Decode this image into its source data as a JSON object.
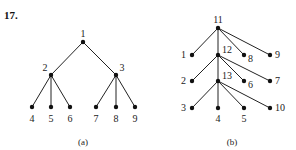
{
  "problem_number": "17.",
  "trees": [
    {
      "caption": "(a)",
      "nodes": [
        {
          "id": "1",
          "x": 83,
          "y": 42,
          "lx": 83,
          "ly": 37,
          "anchor": "middle"
        },
        {
          "id": "2",
          "x": 51,
          "y": 75,
          "lx": 45,
          "ly": 71,
          "anchor": "middle"
        },
        {
          "id": "3",
          "x": 116,
          "y": 75,
          "lx": 122,
          "ly": 71,
          "anchor": "middle"
        },
        {
          "id": "4",
          "x": 32,
          "y": 107,
          "lx": 32,
          "ly": 122,
          "anchor": "middle"
        },
        {
          "id": "5",
          "x": 51,
          "y": 107,
          "lx": 51,
          "ly": 122,
          "anchor": "middle"
        },
        {
          "id": "6",
          "x": 70,
          "y": 107,
          "lx": 70,
          "ly": 122,
          "anchor": "middle"
        },
        {
          "id": "7",
          "x": 96,
          "y": 107,
          "lx": 96,
          "ly": 122,
          "anchor": "middle"
        },
        {
          "id": "8",
          "x": 116,
          "y": 107,
          "lx": 116,
          "ly": 122,
          "anchor": "middle"
        },
        {
          "id": "9",
          "x": 135,
          "y": 107,
          "lx": 135,
          "ly": 122,
          "anchor": "middle"
        }
      ],
      "edges": [
        [
          "1",
          "2"
        ],
        [
          "1",
          "3"
        ],
        [
          "2",
          "4"
        ],
        [
          "2",
          "5"
        ],
        [
          "2",
          "6"
        ],
        [
          "3",
          "7"
        ],
        [
          "3",
          "8"
        ],
        [
          "3",
          "9"
        ]
      ],
      "caption_x": 83,
      "caption_y": 145
    },
    {
      "caption": "(b)",
      "nodes": [
        {
          "id": "11",
          "x": 218,
          "y": 28,
          "lx": 218,
          "ly": 23,
          "anchor": "middle"
        },
        {
          "id": "12",
          "x": 218,
          "y": 55,
          "lx": 222,
          "ly": 53,
          "anchor": "start"
        },
        {
          "id": "13",
          "x": 218,
          "y": 81,
          "lx": 222,
          "ly": 79,
          "anchor": "start"
        },
        {
          "id": "1",
          "x": 192,
          "y": 55,
          "lx": 186,
          "ly": 58,
          "anchor": "end"
        },
        {
          "id": "8",
          "x": 244,
          "y": 55,
          "lx": 248,
          "ly": 62,
          "anchor": "start"
        },
        {
          "id": "9",
          "x": 270,
          "y": 55,
          "lx": 275,
          "ly": 58,
          "anchor": "start"
        },
        {
          "id": "2",
          "x": 192,
          "y": 81,
          "lx": 186,
          "ly": 84,
          "anchor": "end"
        },
        {
          "id": "6",
          "x": 244,
          "y": 81,
          "lx": 248,
          "ly": 88,
          "anchor": "start"
        },
        {
          "id": "7",
          "x": 270,
          "y": 81,
          "lx": 275,
          "ly": 84,
          "anchor": "start"
        },
        {
          "id": "3",
          "x": 192,
          "y": 108,
          "lx": 186,
          "ly": 111,
          "anchor": "end"
        },
        {
          "id": "4",
          "x": 218,
          "y": 108,
          "lx": 218,
          "ly": 122,
          "anchor": "middle"
        },
        {
          "id": "5",
          "x": 244,
          "y": 108,
          "lx": 244,
          "ly": 122,
          "anchor": "middle"
        },
        {
          "id": "10",
          "x": 270,
          "y": 108,
          "lx": 275,
          "ly": 111,
          "anchor": "start"
        }
      ],
      "edges": [
        [
          "11",
          "1"
        ],
        [
          "11",
          "12"
        ],
        [
          "11",
          "8"
        ],
        [
          "11",
          "9"
        ],
        [
          "12",
          "2"
        ],
        [
          "12",
          "13"
        ],
        [
          "12",
          "6"
        ],
        [
          "12",
          "7"
        ],
        [
          "13",
          "3"
        ],
        [
          "13",
          "4"
        ],
        [
          "13",
          "5"
        ],
        [
          "13",
          "10"
        ]
      ],
      "caption_x": 232,
      "caption_y": 145
    }
  ]
}
